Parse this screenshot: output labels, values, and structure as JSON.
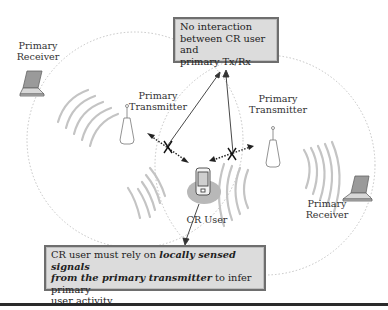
{
  "figure": {
    "top_callout": {
      "line1": "No interaction",
      "line2": "between CR user and",
      "line3": "primary Tx/Rx"
    },
    "bottom_callout": {
      "text_part1": "CR user must rely on ",
      "emphasis1": "locally sensed signals",
      "emphasis2": "from the primary transmitter",
      "text_part2": " to infer primary",
      "text_part3": "user activity"
    },
    "labels": {
      "primary_receiver_left_1": "Primary",
      "primary_receiver_left_2": "Receiver",
      "primary_transmitter_left_1": "Primary",
      "primary_transmitter_left_2": "Transmitter",
      "primary_transmitter_right_1": "Primary",
      "primary_transmitter_right_2": "Transmitter",
      "primary_receiver_right_1": "Primary",
      "primary_receiver_right_2": "Receiver",
      "cr_user": "CR User"
    },
    "icons": [
      "laptop-icon",
      "transmitter-tower-icon",
      "mobile-device-icon",
      "signal-waves-icon",
      "blocked-link-icon"
    ]
  }
}
